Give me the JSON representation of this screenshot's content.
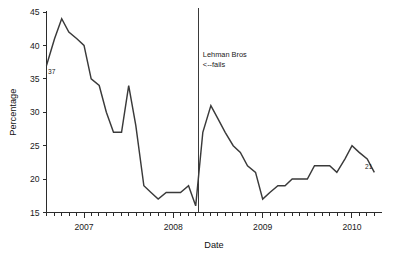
{
  "chart_data": {
    "type": "line",
    "title": "",
    "xlabel": "Date",
    "ylabel": "Percentage",
    "ylim": [
      15,
      45
    ],
    "yticks": [
      15,
      20,
      25,
      30,
      35,
      40,
      45
    ],
    "ytick_labels": [
      "15",
      "20",
      "25",
      "30",
      "35",
      "40",
      "45"
    ],
    "xlim": [
      2006.58,
      2010.33
    ],
    "xtick_labels": [
      "2007",
      "2008",
      "2009",
      "2010"
    ],
    "xtick_positions": [
      2007.0,
      2008.0,
      2009.0,
      2010.0
    ],
    "minor_tick_interval_years": 0.0833,
    "grid": false,
    "legend": null,
    "line_color": "#3a3a3a",
    "x": [
      2006.58,
      2006.67,
      2006.75,
      2006.83,
      2006.92,
      2007.0,
      2007.08,
      2007.17,
      2007.25,
      2007.33,
      2007.42,
      2007.5,
      2007.58,
      2007.67,
      2007.75,
      2007.83,
      2007.92,
      2008.0,
      2008.08,
      2008.17,
      2008.25,
      2008.33,
      2008.42,
      2008.5,
      2008.58,
      2008.67,
      2008.75,
      2008.83,
      2008.92,
      2009.0,
      2009.08,
      2009.17,
      2009.25,
      2009.33,
      2009.42,
      2009.5,
      2009.58,
      2009.67,
      2009.75,
      2009.83,
      2009.92,
      2010.0,
      2010.08,
      2010.17,
      2010.25
    ],
    "values": [
      37,
      41,
      44,
      42,
      41,
      40,
      35,
      34,
      30,
      27,
      27,
      34,
      28,
      19,
      18,
      17,
      18,
      18,
      18,
      19,
      16,
      27,
      31,
      29,
      27,
      25,
      24,
      22,
      21,
      17,
      18,
      19,
      19,
      20,
      20,
      20,
      22,
      22,
      22,
      21,
      23,
      25,
      24,
      23,
      21
    ],
    "point_labels": [
      {
        "text": "37",
        "x": 2006.58,
        "y": 37,
        "position": "below-right"
      },
      {
        "text": "21",
        "x": 2010.25,
        "y": 21,
        "position": "above-left"
      }
    ],
    "annotations": [
      {
        "name": "lehman-event-line",
        "type": "vline",
        "x": 2008.28,
        "y_top": 45.6,
        "y_bottom": 15
      },
      {
        "name": "lehman-annotation",
        "type": "text",
        "lines": [
          "Lehman Bros",
          "<--fails"
        ],
        "x": 2008.33,
        "y": 38.2
      }
    ]
  }
}
